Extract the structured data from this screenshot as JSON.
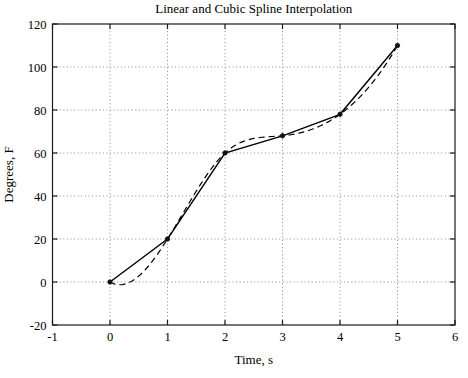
{
  "chart_data": {
    "type": "line",
    "title": "Linear and Cubic Spline Interpolation",
    "xlabel": "Time, s",
    "ylabel": "Degrees, F",
    "xlim": [
      -1,
      6
    ],
    "ylim": [
      -20,
      120
    ],
    "xticks": [
      -1,
      0,
      1,
      2,
      3,
      4,
      5,
      6
    ],
    "yticks": [
      -20,
      0,
      20,
      40,
      60,
      80,
      100,
      120
    ],
    "grid": true,
    "grid_style": "dotted",
    "legend": "none",
    "data_points": {
      "x": [
        0,
        1,
        2,
        3,
        4,
        5
      ],
      "y": [
        0,
        20,
        60,
        68,
        78,
        110
      ]
    },
    "series": [
      {
        "name": "Linear interpolation",
        "style": "solid",
        "interpolation": "linear"
      },
      {
        "name": "Cubic spline interpolation",
        "style": "dashed",
        "interpolation": "cubic-spline-not-a-knot"
      }
    ],
    "colors": {
      "line": "#000000",
      "grid": "#8a8a8a",
      "box": "#1a1a1a",
      "marker": "#111111",
      "background": "#ffffff"
    }
  }
}
